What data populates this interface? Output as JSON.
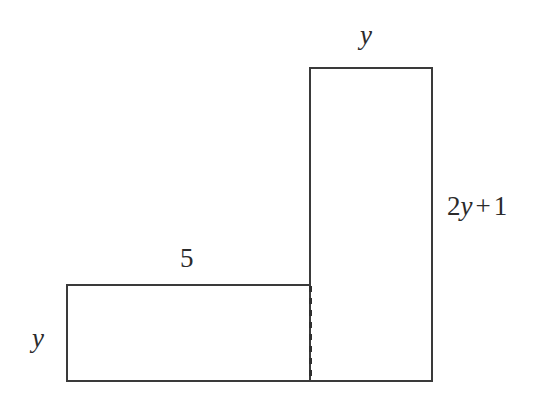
{
  "figure": {
    "background_color": "#ffffff",
    "stroke_color": "#3a3a3a",
    "text_color": "#2b2b2b",
    "stroke_width": 1.6,
    "dashed_stroke_pattern": "6 6",
    "shapes": [
      {
        "name": "tall-rectangle",
        "x": 309,
        "y": 67,
        "width": 123,
        "height": 314,
        "fill": "none"
      },
      {
        "name": "wide-rectangle",
        "x": 66,
        "y": 284,
        "width": 244,
        "height": 97,
        "fill": "none"
      }
    ],
    "divider": {
      "name": "dashed-divider",
      "x1": 310,
      "y1": 285,
      "x2": 310,
      "y2": 380,
      "style": "dashed"
    },
    "labels": [
      {
        "id": "top-y",
        "text": "y",
        "style": "italic",
        "position": "above-tall-rectangle-top-edge",
        "describes": "tall-rectangle-width"
      },
      {
        "id": "right-expression",
        "text": "2y + 1",
        "parts": [
          {
            "text": "2",
            "style": "upright"
          },
          {
            "text": "y",
            "style": "italic"
          },
          {
            "text": "+",
            "style": "upright"
          },
          {
            "text": "1",
            "style": "upright"
          }
        ],
        "position": "right-of-tall-rectangle",
        "describes": "tall-rectangle-height"
      },
      {
        "id": "five",
        "text": "5",
        "style": "upright",
        "position": "above-wide-rectangle-top-edge",
        "describes": "wide-rectangle-width"
      },
      {
        "id": "left-y",
        "text": "y",
        "style": "italic",
        "position": "left-of-wide-rectangle",
        "describes": "wide-rectangle-height"
      }
    ]
  }
}
